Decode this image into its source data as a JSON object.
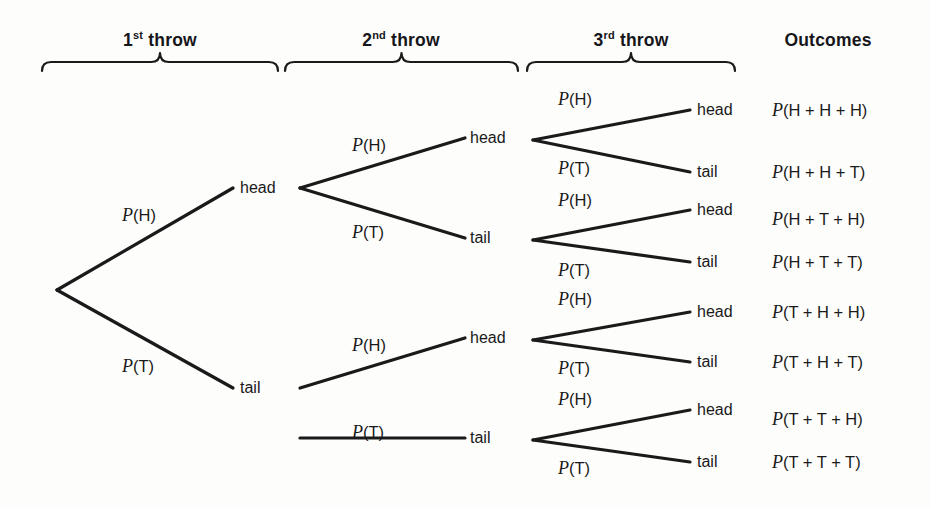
{
  "figure": {
    "type": "probability-tree",
    "line_color": "#1a1a1a",
    "background": "#fdfdfc"
  },
  "headers": [
    {
      "name": "throw-1",
      "text": "1",
      "sup": "st",
      "suffix": " throw",
      "cx": 160,
      "y": 30,
      "brace": {
        "x1": 42,
        "x2": 278,
        "y": 62
      }
    },
    {
      "name": "throw-2",
      "text": "2",
      "sup": "nd",
      "suffix": " throw",
      "cx": 401,
      "y": 30,
      "brace": {
        "x1": 285,
        "x2": 518,
        "y": 62
      }
    },
    {
      "name": "throw-3",
      "text": "3",
      "sup": "rd",
      "suffix": " throw",
      "cx": 631,
      "y": 30,
      "brace": {
        "x1": 527,
        "x2": 735,
        "y": 62
      }
    },
    {
      "name": "outcomes",
      "text": "Outcomes",
      "sup": "",
      "suffix": "",
      "cx": 828,
      "y": 30,
      "brace": null
    }
  ],
  "nodes": {
    "root": {
      "x": 57,
      "y": 290
    },
    "level1": [
      {
        "name": "l1-head",
        "label": "head",
        "x": 233,
        "y": 188,
        "text_x": 240
      },
      {
        "name": "l1-tail",
        "label": "tail",
        "x": 233,
        "y": 388,
        "text_x": 240
      }
    ],
    "level2": [
      {
        "name": "l2-head-head",
        "label": "head",
        "x": 465,
        "y": 138,
        "text_x": 470,
        "parent_x": 300,
        "parent_y": 188
      },
      {
        "name": "l2-head-tail",
        "label": "tail",
        "x": 465,
        "y": 238,
        "text_x": 470,
        "parent_x": 300,
        "parent_y": 188
      },
      {
        "name": "l2-tail-head",
        "label": "head",
        "x": 465,
        "y": 338,
        "text_x": 470,
        "parent_x": 300,
        "parent_y": 388
      },
      {
        "name": "l2-tail-tail",
        "label": "tail",
        "x": 465,
        "y": 438,
        "text_x": 470,
        "parent_x": 300,
        "parent_y": 438
      }
    ],
    "level3": [
      {
        "name": "l3-hhh",
        "label": "head",
        "x": 690,
        "y": 110,
        "text_x": 697,
        "parent_x": 533,
        "parent_y": 140
      },
      {
        "name": "l3-hht",
        "label": "tail",
        "x": 690,
        "y": 172,
        "text_x": 697,
        "parent_x": 533,
        "parent_y": 140
      },
      {
        "name": "l3-hth",
        "label": "head",
        "x": 690,
        "y": 210,
        "text_x": 697,
        "parent_x": 533,
        "parent_y": 240
      },
      {
        "name": "l3-htt",
        "label": "tail",
        "x": 690,
        "y": 262,
        "text_x": 697,
        "parent_x": 533,
        "parent_y": 240
      },
      {
        "name": "l3-thh",
        "label": "head",
        "x": 690,
        "y": 312,
        "text_x": 697,
        "parent_x": 533,
        "parent_y": 340
      },
      {
        "name": "l3-tht",
        "label": "tail",
        "x": 690,
        "y": 362,
        "text_x": 697,
        "parent_x": 533,
        "parent_y": 340
      },
      {
        "name": "l3-tth",
        "label": "head",
        "x": 690,
        "y": 410,
        "text_x": 697,
        "parent_x": 533,
        "parent_y": 440
      },
      {
        "name": "l3-ttt",
        "label": "tail",
        "x": 690,
        "y": 462,
        "text_x": 697,
        "parent_x": 533,
        "parent_y": 440
      }
    ]
  },
  "branch_labels": {
    "level1": [
      {
        "name": "branch-label-1-head",
        "p": "P",
        "arg": "(H)",
        "x": 122,
        "y": 215
      },
      {
        "name": "branch-label-1-tail",
        "p": "P",
        "arg": "(T)",
        "x": 122,
        "y": 366
      }
    ],
    "level2": [
      {
        "name": "branch-label-2-hh",
        "p": "P",
        "arg": "(H)",
        "x": 352,
        "y": 145
      },
      {
        "name": "branch-label-2-ht",
        "p": "P",
        "arg": "(T)",
        "x": 352,
        "y": 232
      },
      {
        "name": "branch-label-2-th",
        "p": "P",
        "arg": "(H)",
        "x": 352,
        "y": 345
      },
      {
        "name": "branch-label-2-tt",
        "p": "P",
        "arg": "(T)",
        "x": 352,
        "y": 432
      }
    ],
    "level3": [
      {
        "name": "branch-label-3-hhh",
        "p": "P",
        "arg": "(H)",
        "x": 558,
        "y": 99
      },
      {
        "name": "branch-label-3-hht",
        "p": "P",
        "arg": "(T)",
        "x": 558,
        "y": 168
      },
      {
        "name": "branch-label-3-hth",
        "p": "P",
        "arg": "(H)",
        "x": 558,
        "y": 200
      },
      {
        "name": "branch-label-3-htt",
        "p": "P",
        "arg": "(T)",
        "x": 558,
        "y": 270
      },
      {
        "name": "branch-label-3-thh",
        "p": "P",
        "arg": "(H)",
        "x": 558,
        "y": 299
      },
      {
        "name": "branch-label-3-tht",
        "p": "P",
        "arg": "(T)",
        "x": 558,
        "y": 368
      },
      {
        "name": "branch-label-3-tth",
        "p": "P",
        "arg": "(H)",
        "x": 558,
        "y": 399
      },
      {
        "name": "branch-label-3-ttt",
        "p": "P",
        "arg": "(T)",
        "x": 558,
        "y": 468
      }
    ]
  },
  "outcomes": [
    {
      "name": "outcome-hhh",
      "p": "P",
      "expr": "(H + H + H)",
      "x": 772,
      "y": 110
    },
    {
      "name": "outcome-hht",
      "p": "P",
      "expr": "(H + H + T)",
      "x": 772,
      "y": 172
    },
    {
      "name": "outcome-hth",
      "p": "P",
      "expr": "(H + T + H)",
      "x": 772,
      "y": 219
    },
    {
      "name": "outcome-htt",
      "p": "P",
      "expr": "(H + T + T)",
      "x": 772,
      "y": 262
    },
    {
      "name": "outcome-thh",
      "p": "P",
      "expr": "(T + H + H)",
      "x": 772,
      "y": 312
    },
    {
      "name": "outcome-tht",
      "p": "P",
      "expr": "(T + H + T)",
      "x": 772,
      "y": 362
    },
    {
      "name": "outcome-tth",
      "p": "P",
      "expr": "(T + T + H)",
      "x": 772,
      "y": 419
    },
    {
      "name": "outcome-ttt",
      "p": "P",
      "expr": "(T + T + T)",
      "x": 772,
      "y": 462
    }
  ]
}
